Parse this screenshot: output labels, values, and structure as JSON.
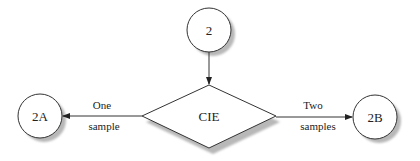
{
  "diagram": {
    "type": "flowchart",
    "nodes": [
      {
        "id": "n2",
        "shape": "circle",
        "label": "2",
        "cx": 209,
        "cy": 30,
        "r": 22
      },
      {
        "id": "cie",
        "shape": "diamond",
        "label": "CIE",
        "cx": 209,
        "cy": 116,
        "hw": 67,
        "hh": 31
      },
      {
        "id": "n2a",
        "shape": "circle",
        "label": "2A",
        "cx": 40,
        "cy": 116,
        "r": 22
      },
      {
        "id": "n2b",
        "shape": "circle",
        "label": "2B",
        "cx": 375,
        "cy": 117,
        "r": 22
      }
    ],
    "edges": [
      {
        "from": "n2",
        "to": "cie",
        "label_line1": "",
        "label_line2": ""
      },
      {
        "from": "cie",
        "to": "n2a",
        "label_line1": "One",
        "label_line2": "sample"
      },
      {
        "from": "cie",
        "to": "n2b",
        "label_line1": "Two",
        "label_line2": "samples"
      }
    ],
    "colors": {
      "stroke": "#333333",
      "fill": "#ffffff",
      "shadow": "#b8b8b8",
      "background": "#ffffff"
    }
  }
}
